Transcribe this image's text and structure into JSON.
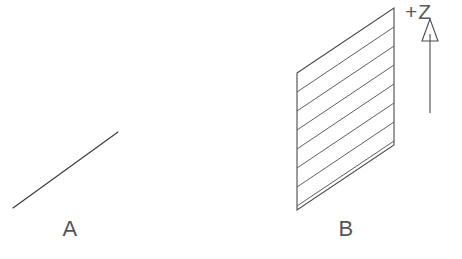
{
  "figure": {
    "background_color": "#ffffff",
    "line_color": "#3a3a3a",
    "hatch_color": "#565656",
    "label_color": "#555555",
    "width": 462,
    "height": 259
  },
  "panel_a": {
    "label": "A",
    "label_x": 70,
    "label_y": 236,
    "description": "single diagonal line segment",
    "line": {
      "x1": 13,
      "y1": 208,
      "x2": 118,
      "y2": 132
    }
  },
  "panel_b": {
    "label": "B",
    "label_x": 346,
    "label_y": 236,
    "description": "hatched parallelogram plane in isometric view",
    "polygon_points": "297,73 394,8 394,145 297,210",
    "corners": [
      {
        "name": "top-left",
        "x": 297,
        "y": 73
      },
      {
        "name": "top-right",
        "x": 394,
        "y": 8
      },
      {
        "name": "bottom-right",
        "x": 394,
        "y": 145
      },
      {
        "name": "bottom-left",
        "x": 297,
        "y": 210
      }
    ],
    "hatch": {
      "count": 7,
      "spacing": 19,
      "lines": [
        {
          "x1": 297,
          "y1": 92,
          "x2": 394,
          "y2": 27
        },
        {
          "x1": 297,
          "y1": 111,
          "x2": 394,
          "y2": 46
        },
        {
          "x1": 297,
          "y1": 130,
          "x2": 394,
          "y2": 65
        },
        {
          "x1": 297,
          "y1": 149,
          "x2": 394,
          "y2": 84
        },
        {
          "x1": 297,
          "y1": 168,
          "x2": 394,
          "y2": 103
        },
        {
          "x1": 297,
          "y1": 187,
          "x2": 394,
          "y2": 122
        },
        {
          "x1": 297,
          "y1": 206,
          "x2": 394,
          "y2": 141
        }
      ]
    }
  },
  "axis_annotation": {
    "label": "+Z",
    "label_x": 405,
    "label_y": 19,
    "direction": "up",
    "arrow": {
      "shaft_x": 430,
      "shaft_top_y": 34,
      "shaft_bottom_y": 113,
      "head_points": "430,19 422,41 438,41",
      "head_filled": false
    }
  }
}
